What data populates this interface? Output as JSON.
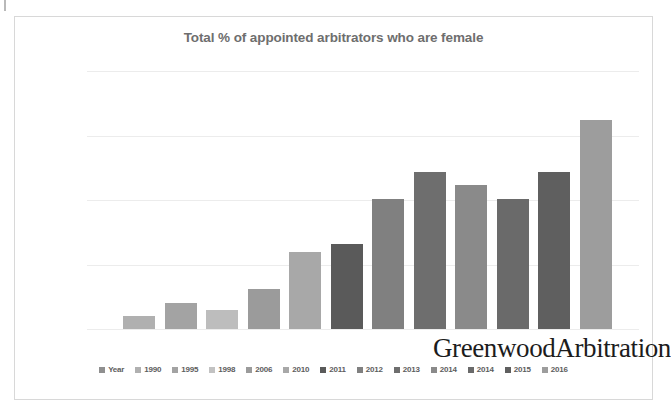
{
  "scan": {
    "artifact": "scan-edge-mark"
  },
  "figure": {
    "watermark": "GreenwoodArbitration"
  },
  "chart_data": {
    "type": "bar",
    "title": "Total % of appointed arbitrators who are female",
    "xlabel": "",
    "ylabel": "",
    "ylim": [
      0,
      20
    ],
    "grid": true,
    "legend_position": "bottom",
    "ytick_labels": [
      "0%",
      "5%",
      "10%",
      "15%",
      "20%"
    ],
    "ytick_values": [
      0,
      5,
      10,
      15,
      20
    ],
    "legend_entries": [
      "Year",
      "1990",
      "1995",
      "1998",
      "2006",
      "2010",
      "2011",
      "2012",
      "2013",
      "2014",
      "2014",
      "2015",
      "2016"
    ],
    "categories": [
      "1990",
      "1995",
      "1998",
      "2006",
      "2010",
      "2011",
      "2012",
      "2013",
      "2014",
      "2014",
      "2015",
      "2016"
    ],
    "values": [
      1.0,
      2.0,
      1.5,
      3.1,
      6.0,
      6.6,
      10.1,
      12.2,
      11.2,
      10.1,
      12.2,
      16.2
    ],
    "bar_colors": [
      "#b0b0b0",
      "#a3a3a3",
      "#bdbdbd",
      "#9b9b9b",
      "#a8a8a8",
      "#5a5a5a",
      "#808080",
      "#6e6e6e",
      "#8a8a8a",
      "#6a6a6a",
      "#5f5f5f",
      "#9d9d9d"
    ],
    "legend_swatch_colors": [
      "#8f8f8f",
      "#b0b0b0",
      "#a3a3a3",
      "#c2c2c2",
      "#9b9b9b",
      "#a8a8a8",
      "#5a5a5a",
      "#808080",
      "#6e6e6e",
      "#8a8a8a",
      "#6a6a6a",
      "#5f5f5f",
      "#9d9d9d"
    ]
  }
}
